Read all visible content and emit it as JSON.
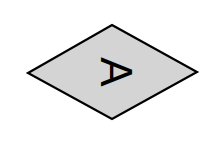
{
  "diagram": {
    "shape": "diamond",
    "label": "A",
    "label_rotation_deg": 90,
    "colors": {
      "fill": "#d4d4d4",
      "stroke": "#000000",
      "text": "#000000",
      "background": "#ffffff"
    }
  }
}
